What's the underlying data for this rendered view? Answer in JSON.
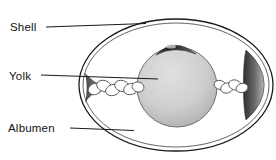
{
  "diagram": {
    "labels": {
      "shell": "Shell",
      "yolk": "Yolk",
      "albumen": "Albumen"
    },
    "colors": {
      "background": "#ffffff",
      "outline": "#1a1a1a",
      "membrane_line": "#555555",
      "text": "#111111",
      "yolk_fill_light": "#dedede",
      "yolk_fill_dark": "#979797",
      "yolk_edge": "#6f6f6f",
      "germinal_disc_dark": "#1c1c1c",
      "air_cell_dark": "#2e2e2e",
      "air_cell_light": "#b5b5b5",
      "chalaza_fill": "#ffffff",
      "chalaza_stroke": "#5a5a5a"
    }
  }
}
